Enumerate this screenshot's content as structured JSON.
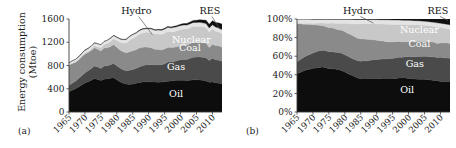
{
  "figure": {
    "panels": [
      {
        "tag": "(a)",
        "ylabel_line1": "Energy consumption",
        "ylabel_line2": "(Mtoe)"
      },
      {
        "tag": "(b)",
        "ylabel_line1": "Share (%)",
        "ylabel_line2": ""
      }
    ]
  },
  "chart_data": [
    {
      "type": "area",
      "stacked": true,
      "title": "",
      "xlabel": "",
      "ylabel": "Energy consumption (Mtoe)",
      "ylim": [
        0,
        1600
      ],
      "yticks": [
        0,
        400,
        800,
        1200,
        1600
      ],
      "ytick_labels": [
        "0",
        "400",
        "800",
        "1200",
        "1600"
      ],
      "xlim": [
        1965,
        2013
      ],
      "xticks": [
        1965,
        1970,
        1975,
        1980,
        1985,
        1990,
        1995,
        2000,
        2005,
        2010
      ],
      "xtick_labels": [
        "1965",
        "1970",
        "1975",
        "1980",
        "1985",
        "1990",
        "1995",
        "2000",
        "2005",
        "2010"
      ],
      "grid": false,
      "legend": "in-plot annotations",
      "x": [
        1965,
        1966,
        1967,
        1968,
        1969,
        1970,
        1971,
        1972,
        1973,
        1974,
        1975,
        1976,
        1977,
        1978,
        1979,
        1980,
        1981,
        1982,
        1983,
        1984,
        1985,
        1986,
        1987,
        1988,
        1989,
        1990,
        1991,
        1992,
        1993,
        1994,
        1995,
        1996,
        1997,
        1998,
        1999,
        2000,
        2001,
        2002,
        2003,
        2004,
        2005,
        2006,
        2007,
        2008,
        2009,
        2010,
        2011,
        2012,
        2013
      ],
      "series": [
        {
          "name": "Oil",
          "color": "#0d0d0d",
          "values": [
            350,
            375,
            400,
            430,
            465,
            500,
            520,
            545,
            575,
            560,
            540,
            565,
            570,
            580,
            590,
            555,
            520,
            495,
            480,
            475,
            480,
            495,
            505,
            515,
            520,
            520,
            515,
            515,
            510,
            515,
            520,
            530,
            535,
            540,
            545,
            545,
            545,
            540,
            545,
            555,
            555,
            550,
            545,
            535,
            510,
            515,
            505,
            495,
            490
          ]
        },
        {
          "name": "Gas",
          "color": "#4a4a4a",
          "values": [
            110,
            120,
            130,
            145,
            160,
            175,
            190,
            205,
            215,
            215,
            210,
            225,
            225,
            235,
            245,
            240,
            235,
            230,
            230,
            245,
            250,
            255,
            270,
            280,
            290,
            295,
            300,
            295,
            300,
            300,
            310,
            330,
            325,
            330,
            340,
            355,
            360,
            365,
            380,
            385,
            390,
            395,
            395,
            400,
            375,
            410,
            395,
            395,
            385
          ]
        },
        {
          "name": "Coal",
          "color": "#8a8a8a",
          "values": [
            345,
            340,
            325,
            320,
            325,
            325,
            315,
            310,
            315,
            305,
            300,
            310,
            310,
            310,
            325,
            320,
            310,
            310,
            310,
            315,
            325,
            320,
            325,
            320,
            310,
            300,
            285,
            270,
            265,
            255,
            255,
            255,
            250,
            245,
            240,
            240,
            245,
            245,
            255,
            255,
            250,
            255,
            255,
            250,
            225,
            240,
            245,
            250,
            240
          ]
        },
        {
          "name": "Nuclear",
          "color": "#c8c8c8",
          "values": [
            3,
            5,
            7,
            10,
            13,
            17,
            22,
            28,
            35,
            42,
            55,
            62,
            75,
            88,
            100,
            115,
            135,
            150,
            170,
            200,
            215,
            225,
            235,
            245,
            250,
            255,
            260,
            260,
            265,
            268,
            270,
            272,
            270,
            272,
            275,
            278,
            280,
            280,
            275,
            278,
            278,
            275,
            272,
            268,
            265,
            268,
            245,
            235,
            230
          ]
        },
        {
          "name": "Hydro",
          "color": "#e4e4e4",
          "values": [
            38,
            40,
            42,
            43,
            45,
            46,
            47,
            47,
            48,
            52,
            51,
            50,
            53,
            56,
            55,
            56,
            57,
            58,
            61,
            62,
            62,
            62,
            62,
            64,
            61,
            65,
            66,
            65,
            69,
            68,
            71,
            71,
            68,
            70,
            70,
            70,
            68,
            66,
            64,
            68,
            68,
            68,
            67,
            70,
            71,
            69,
            72,
            71,
            74
          ]
        },
        {
          "name": "RES",
          "color": "#111111",
          "values": [
            1,
            1,
            1,
            1,
            1,
            2,
            2,
            2,
            2,
            2,
            3,
            3,
            3,
            4,
            4,
            4,
            5,
            5,
            6,
            6,
            7,
            7,
            8,
            8,
            9,
            9,
            10,
            11,
            12,
            13,
            14,
            15,
            16,
            18,
            20,
            22,
            24,
            27,
            30,
            34,
            38,
            43,
            49,
            56,
            62,
            70,
            78,
            86,
            94
          ]
        }
      ],
      "annotations": [
        {
          "text": "Hydro",
          "kind": "leader-label"
        },
        {
          "text": "RES",
          "kind": "leader-label"
        },
        {
          "text": "Nuclear",
          "kind": "inline-light"
        },
        {
          "text": "Coal",
          "kind": "inline-light"
        },
        {
          "text": "Gas",
          "kind": "inline-light"
        },
        {
          "text": "Oil",
          "kind": "inline-light"
        }
      ]
    },
    {
      "type": "area",
      "stacked": true,
      "normalized": true,
      "title": "",
      "xlabel": "",
      "ylabel": "Share (%)",
      "ylim": [
        0,
        100
      ],
      "yticks": [
        0,
        20,
        40,
        60,
        80,
        100
      ],
      "ytick_labels": [
        "0%",
        "20%",
        "40%",
        "60%",
        "80%",
        "100%"
      ],
      "xlim": [
        1965,
        2013
      ],
      "xticks": [
        1965,
        1970,
        1975,
        1980,
        1985,
        1990,
        1995,
        2000,
        2005,
        2010
      ],
      "xtick_labels": [
        "1965",
        "1970",
        "1975",
        "1980",
        "1985",
        "1990",
        "1995",
        "2000",
        "2005",
        "2010"
      ],
      "grid": false,
      "legend": "in-plot annotations",
      "note": "same six series as panel (a), expressed as percentage shares of the annual total",
      "annotations": [
        {
          "text": "Hydro",
          "kind": "leader-label"
        },
        {
          "text": "RES",
          "kind": "leader-label"
        },
        {
          "text": "Nuclear",
          "kind": "inline-light"
        },
        {
          "text": "Coal",
          "kind": "inline-light"
        },
        {
          "text": "Gas",
          "kind": "inline-light"
        },
        {
          "text": "Oil",
          "kind": "inline-light"
        }
      ]
    }
  ],
  "labels": {
    "hydro": "Hydro",
    "res": "RES",
    "nuclear": "Nuclear",
    "coal": "Coal",
    "gas": "Gas",
    "oil": "Oil"
  },
  "colors": {
    "oil": "#0d0d0d",
    "gas": "#4a4a4a",
    "coal": "#8a8a8a",
    "nuclear": "#c8c8c8",
    "hydro": "#e4e4e4",
    "res": "#111111",
    "axis": "#3a3a3a",
    "text": "#1a1a1a"
  }
}
